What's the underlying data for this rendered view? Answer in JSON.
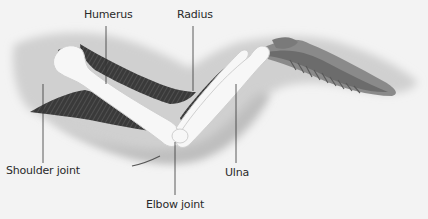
{
  "diagram": {
    "colors": {
      "background": "#f3f3f3",
      "wing_silhouette": "#d2d2d2",
      "wing_shadow": "#bcbcbc",
      "bone": "#f7f7f7",
      "bone_outline": "#cfcfcf",
      "muscle": "#3f3f3f",
      "muscle_light": "#6a6a6a",
      "feathers": "#7a7a7a",
      "leader_line": "#333333",
      "text": "#2a2a2a"
    },
    "labels": [
      {
        "id": "humerus",
        "text": "Humerus"
      },
      {
        "id": "radius",
        "text": "Radius"
      },
      {
        "id": "shoulder-joint",
        "text": "Shoulder joint"
      },
      {
        "id": "ulna",
        "text": "Ulna"
      },
      {
        "id": "elbow-joint",
        "text": "Elbow joint"
      }
    ]
  }
}
